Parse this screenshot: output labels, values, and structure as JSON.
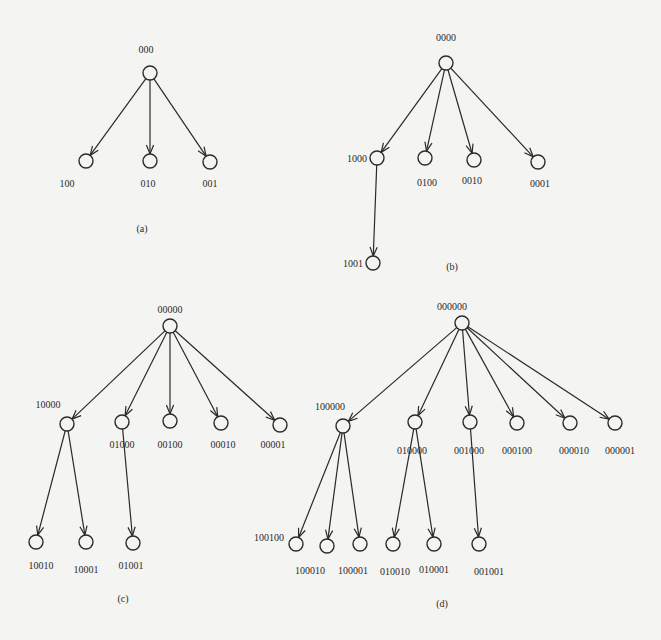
{
  "style": {
    "background": "#f4f4f2",
    "ink": "#2a2a2a",
    "node_radius": 7
  },
  "diagrams": [
    {
      "caption": "(a)",
      "caption_pos": [
        142,
        232
      ],
      "nodes": [
        {
          "id": "000",
          "label": "000",
          "x": 150,
          "y": 73,
          "lx": 146,
          "ly": 53,
          "anchor": "middle"
        },
        {
          "id": "100",
          "label": "100",
          "x": 86,
          "y": 161,
          "lx": 67,
          "ly": 187,
          "anchor": "middle"
        },
        {
          "id": "010",
          "label": "010",
          "x": 150,
          "y": 161,
          "lx": 148,
          "ly": 187,
          "anchor": "middle"
        },
        {
          "id": "001",
          "label": "001",
          "x": 210,
          "y": 162,
          "lx": 210,
          "ly": 187,
          "anchor": "middle"
        }
      ],
      "edges": [
        [
          "000",
          "100"
        ],
        [
          "000",
          "010"
        ],
        [
          "000",
          "001"
        ]
      ]
    },
    {
      "caption": "(b)",
      "caption_pos": [
        452,
        270
      ],
      "nodes": [
        {
          "id": "0000",
          "label": "0000",
          "x": 446,
          "y": 63,
          "lx": 446,
          "ly": 41,
          "anchor": "middle"
        },
        {
          "id": "1000",
          "label": "1000",
          "x": 377,
          "y": 158,
          "lx": 367,
          "ly": 162,
          "anchor": "end"
        },
        {
          "id": "0100",
          "label": "0100",
          "x": 425,
          "y": 158,
          "lx": 427,
          "ly": 186,
          "anchor": "middle"
        },
        {
          "id": "0010",
          "label": "0010",
          "x": 474,
          "y": 160,
          "lx": 472,
          "ly": 184,
          "anchor": "middle"
        },
        {
          "id": "0001",
          "label": "0001",
          "x": 538,
          "y": 162,
          "lx": 540,
          "ly": 187,
          "anchor": "middle"
        },
        {
          "id": "1001",
          "label": "1001",
          "x": 373,
          "y": 263,
          "lx": 363,
          "ly": 267,
          "anchor": "end"
        }
      ],
      "edges": [
        [
          "0000",
          "1000"
        ],
        [
          "0000",
          "0100"
        ],
        [
          "0000",
          "0010"
        ],
        [
          "0000",
          "0001"
        ],
        [
          "1000",
          "1001"
        ]
      ]
    },
    {
      "caption": "(c)",
      "caption_pos": [
        123,
        602
      ],
      "nodes": [
        {
          "id": "00000",
          "label": "00000",
          "x": 170,
          "y": 326,
          "lx": 170,
          "ly": 313,
          "anchor": "middle"
        },
        {
          "id": "10000",
          "label": "10000",
          "x": 67,
          "y": 424,
          "lx": 48,
          "ly": 408,
          "anchor": "middle"
        },
        {
          "id": "01000",
          "label": "01000",
          "x": 122,
          "y": 422,
          "lx": 122,
          "ly": 448,
          "anchor": "middle"
        },
        {
          "id": "00100",
          "label": "00100",
          "x": 170,
          "y": 421,
          "lx": 170,
          "ly": 448,
          "anchor": "middle"
        },
        {
          "id": "00010",
          "label": "00010",
          "x": 221,
          "y": 423,
          "lx": 223,
          "ly": 448,
          "anchor": "middle"
        },
        {
          "id": "00001",
          "label": "00001",
          "x": 280,
          "y": 425,
          "lx": 273,
          "ly": 448,
          "anchor": "middle"
        },
        {
          "id": "10010",
          "label": "10010",
          "x": 36,
          "y": 542,
          "lx": 41,
          "ly": 569,
          "anchor": "middle"
        },
        {
          "id": "10001",
          "label": "10001",
          "x": 86,
          "y": 542,
          "lx": 86,
          "ly": 573,
          "anchor": "middle"
        },
        {
          "id": "01001",
          "label": "01001",
          "x": 133,
          "y": 543,
          "lx": 131,
          "ly": 569,
          "anchor": "middle"
        }
      ],
      "edges": [
        [
          "00000",
          "10000"
        ],
        [
          "00000",
          "01000"
        ],
        [
          "00000",
          "00100"
        ],
        [
          "00000",
          "00010"
        ],
        [
          "00000",
          "00001"
        ],
        [
          "10000",
          "10010"
        ],
        [
          "10000",
          "10001"
        ],
        [
          "01000",
          "01001"
        ]
      ]
    },
    {
      "caption": "(d)",
      "caption_pos": [
        442,
        607
      ],
      "nodes": [
        {
          "id": "000000",
          "label": "000000",
          "x": 462,
          "y": 323,
          "lx": 452,
          "ly": 310,
          "anchor": "middle"
        },
        {
          "id": "100000",
          "label": "100000",
          "x": 343,
          "y": 426,
          "lx": 330,
          "ly": 410,
          "anchor": "middle"
        },
        {
          "id": "010000",
          "label": "010000",
          "x": 415,
          "y": 422,
          "lx": 412,
          "ly": 454,
          "anchor": "middle"
        },
        {
          "id": "001000",
          "label": "001000",
          "x": 470,
          "y": 422,
          "lx": 469,
          "ly": 454,
          "anchor": "middle"
        },
        {
          "id": "000100",
          "label": "000100",
          "x": 517,
          "y": 423,
          "lx": 517,
          "ly": 454,
          "anchor": "middle"
        },
        {
          "id": "000010",
          "label": "000010",
          "x": 570,
          "y": 423,
          "lx": 574,
          "ly": 454,
          "anchor": "middle"
        },
        {
          "id": "000001",
          "label": "000001",
          "x": 615,
          "y": 423,
          "lx": 620,
          "ly": 454,
          "anchor": "middle"
        },
        {
          "id": "100100",
          "label": "100100",
          "x": 296,
          "y": 544,
          "lx": 284,
          "ly": 541,
          "anchor": "end"
        },
        {
          "id": "100010",
          "label": "100010",
          "x": 327,
          "y": 546,
          "lx": 310,
          "ly": 574,
          "anchor": "middle"
        },
        {
          "id": "100001",
          "label": "100001",
          "x": 360,
          "y": 544,
          "lx": 353,
          "ly": 574,
          "anchor": "middle"
        },
        {
          "id": "010010",
          "label": "010010",
          "x": 393,
          "y": 544,
          "lx": 395,
          "ly": 575,
          "anchor": "middle"
        },
        {
          "id": "010001",
          "label": "010001",
          "x": 434,
          "y": 544,
          "lx": 434,
          "ly": 573,
          "anchor": "middle"
        },
        {
          "id": "001001",
          "label": "001001",
          "x": 479,
          "y": 544,
          "lx": 489,
          "ly": 575,
          "anchor": "middle"
        }
      ],
      "edges": [
        [
          "000000",
          "100000"
        ],
        [
          "000000",
          "010000"
        ],
        [
          "000000",
          "001000"
        ],
        [
          "000000",
          "000100"
        ],
        [
          "000000",
          "000010"
        ],
        [
          "000000",
          "000001"
        ],
        [
          "100000",
          "100100"
        ],
        [
          "100000",
          "100010"
        ],
        [
          "100000",
          "100001"
        ],
        [
          "010000",
          "010010"
        ],
        [
          "010000",
          "010001"
        ],
        [
          "001000",
          "001001"
        ]
      ]
    }
  ]
}
